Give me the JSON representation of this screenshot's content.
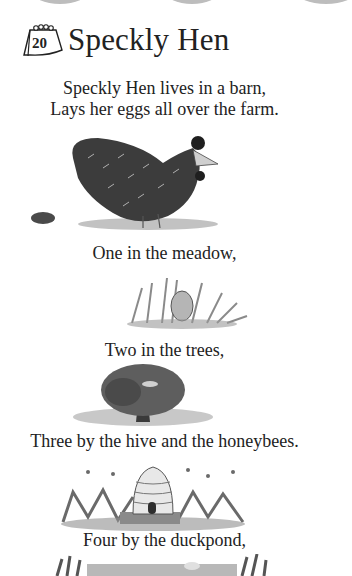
{
  "header": {
    "day_number": "20",
    "title": "Speckly Hen"
  },
  "verse": {
    "line1": "Speckly Hen lives in a barn,",
    "line2": "Lays her eggs all over the farm.",
    "line3": "One in the meadow,",
    "line4": "Two in the trees,",
    "line5": "Three by the hive and the honeybees.",
    "line6": "Four by the duckpond,"
  },
  "illustrations": [
    {
      "name": "speckled-hen",
      "tone": "#3a3a3a"
    },
    {
      "name": "egg-in-meadow-grass",
      "tone": "#8a8a8a"
    },
    {
      "name": "bird-in-tree",
      "tone": "#6a6a6a"
    },
    {
      "name": "beehive-with-bees",
      "tone": "#9a9a9a"
    },
    {
      "name": "duckpond-reeds",
      "tone": "#7a7a7a"
    }
  ]
}
